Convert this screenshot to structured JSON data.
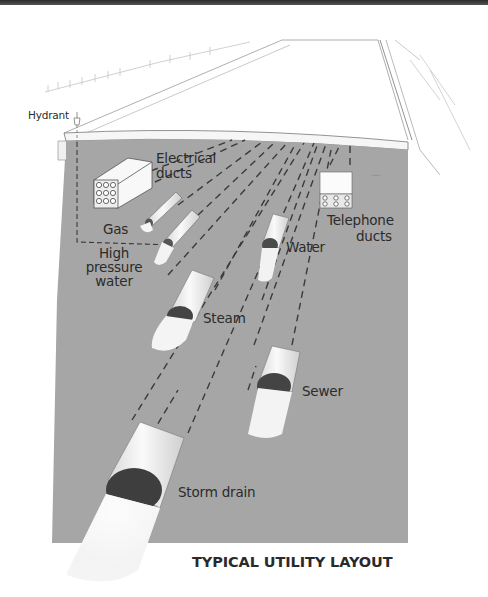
{
  "diagram": {
    "caption": "TYPICAL UTILITY LAYOUT",
    "colors": {
      "ground": "#a6a6a6",
      "street_surface": "#ffffff",
      "dashes": "#3a3a3a",
      "pipe": "#ececec",
      "label_text": "#2b2b2b"
    },
    "labels": {
      "hydrant": "Hydrant",
      "electrical_ducts_1": "Electrical",
      "electrical_ducts_2": "ducts",
      "gas": "Gas",
      "high_pressure_water_1": "High",
      "high_pressure_water_2": "pressure",
      "high_pressure_water_3": "water",
      "water": "Water",
      "telephone_ducts_1": "Telephone",
      "telephone_ducts_2": "ducts",
      "steam": "Steam",
      "sewer": "Sewer",
      "storm_drain": "Storm drain"
    },
    "components": [
      "Hydrant",
      "Electrical ducts",
      "Gas",
      "High pressure water",
      "Water",
      "Telephone ducts",
      "Steam",
      "Sewer",
      "Storm drain"
    ]
  }
}
